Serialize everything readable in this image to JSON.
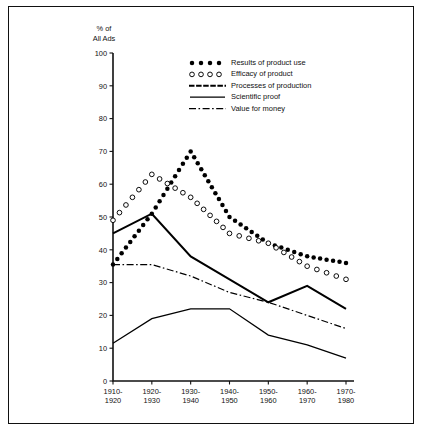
{
  "chart_data": {
    "type": "line",
    "title": "",
    "xlabel": "",
    "ylabel": "% of All Ads",
    "ylabel_line1": "% of",
    "ylabel_line2": "All Ads",
    "ylim": [
      0,
      100
    ],
    "yticks": [
      0,
      10,
      20,
      30,
      40,
      50,
      60,
      70,
      80,
      90,
      100
    ],
    "grid": false,
    "legend_position": "top-right",
    "categories": [
      "1910-1920",
      "1920-1930",
      "1930-1940",
      "1940-1950",
      "1950-1960",
      "1960-1970",
      "1970-1980"
    ],
    "category_lines": [
      {
        "top": "1910-",
        "bottom": "1920"
      },
      {
        "top": "1920-",
        "bottom": "1930"
      },
      {
        "top": "1930-",
        "bottom": "1940"
      },
      {
        "top": "1940-",
        "bottom": "1950"
      },
      {
        "top": "1950-",
        "bottom": "1960"
      },
      {
        "top": "1960-",
        "bottom": "1970"
      },
      {
        "top": "1970-",
        "bottom": "1980"
      }
    ],
    "series": [
      {
        "name": "Results of product use",
        "style": "filled-dots",
        "marker": "filled-circle",
        "values": [
          35.5,
          51,
          70,
          50,
          42,
          38,
          36
        ]
      },
      {
        "name": "Efficacy of product",
        "style": "open-circles",
        "marker": "open-circle",
        "values": [
          49,
          63,
          56,
          45,
          42,
          35,
          31
        ]
      },
      {
        "name": "Processes of production",
        "style": "solid-thick",
        "marker": "none",
        "values": [
          45,
          51,
          38,
          31,
          24,
          29,
          22
        ]
      },
      {
        "name": "Scientific proof",
        "style": "solid-thin",
        "marker": "none",
        "values": [
          11.5,
          19,
          22,
          22,
          14,
          11,
          7
        ]
      },
      {
        "name": "Value for money",
        "style": "dash-dot",
        "marker": "none",
        "values": [
          35.5,
          35.5,
          32,
          27,
          24,
          20,
          16
        ]
      }
    ]
  },
  "legend": {
    "items": [
      {
        "label": "Results of product use",
        "style": "filled-dots"
      },
      {
        "label": "Efficacy of product",
        "style": "open-circles"
      },
      {
        "label": "Processes of production",
        "style": "solid-thick"
      },
      {
        "label": "Scientific proof",
        "style": "solid-thin"
      },
      {
        "label": "Value for money",
        "style": "dash-dot"
      }
    ]
  },
  "colors": {
    "ink": "#000000",
    "frame": "#111111",
    "background": "#ffffff"
  }
}
